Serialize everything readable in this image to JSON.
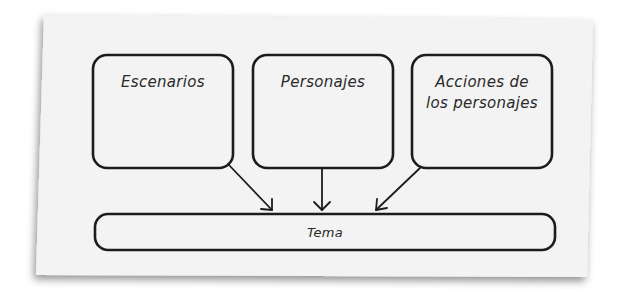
{
  "diagram": {
    "boxes": [
      {
        "id": "escenarios",
        "label": "Escenarios"
      },
      {
        "id": "personajes",
        "label": "Personajes"
      },
      {
        "id": "acciones",
        "label_line1": "Acciones de",
        "label_line2": "los personajes"
      }
    ],
    "target": {
      "id": "tema",
      "label": "Tema"
    },
    "arrows": [
      {
        "from": "escenarios",
        "to": "tema"
      },
      {
        "from": "personajes",
        "to": "tema"
      },
      {
        "from": "acciones",
        "to": "tema"
      }
    ],
    "colors": {
      "paper": "#f3f3f3",
      "stroke": "#1c1c1c",
      "text": "#2a2a2a",
      "shadow": "#9a9a9a"
    }
  }
}
